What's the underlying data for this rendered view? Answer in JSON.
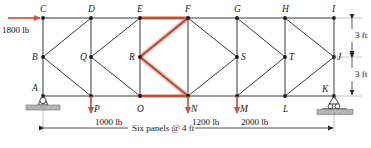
{
  "figure": {
    "type": "statics-truss",
    "span_label": "Six panels @ 4 ft",
    "height_label_upper": "3 ft",
    "height_label_lower": "3 ft"
  },
  "colors": {
    "member": "#3a3a3a",
    "highlight": "#e8694a",
    "load_arrow": "#d4503a",
    "support_fill": "#b8b8b8",
    "text": "#1a1a1a"
  },
  "joints": [
    {
      "id": "A",
      "label": "A",
      "x": 43,
      "y": 96,
      "label_dx": -11,
      "label_dy": -12
    },
    {
      "id": "B",
      "label": "B",
      "x": 43,
      "y": 57,
      "label_dx": -11,
      "label_dy": -4
    },
    {
      "id": "C",
      "label": "C",
      "x": 43,
      "y": 18,
      "label_dx": -3,
      "label_dy": -13
    },
    {
      "id": "D",
      "label": "D",
      "x": 91,
      "y": 18,
      "label_dx": -3,
      "label_dy": -13
    },
    {
      "id": "E",
      "label": "E",
      "x": 140,
      "y": 18,
      "label_dx": -3,
      "label_dy": -13
    },
    {
      "id": "F",
      "label": "F",
      "x": 188,
      "y": 18,
      "label_dx": -3,
      "label_dy": -13
    },
    {
      "id": "G",
      "label": "G",
      "x": 237,
      "y": 18,
      "label_dx": -3,
      "label_dy": -13
    },
    {
      "id": "H",
      "label": "H",
      "x": 285,
      "y": 18,
      "label_dx": -3,
      "label_dy": -13
    },
    {
      "id": "I",
      "label": "I",
      "x": 334,
      "y": 18,
      "label_dx": -2,
      "label_dy": -13
    },
    {
      "id": "J",
      "label": "J",
      "x": 334,
      "y": 57,
      "label_dx": 3,
      "label_dy": -4
    },
    {
      "id": "K",
      "label": "K",
      "x": 334,
      "y": 96,
      "label_dx": -12,
      "label_dy": -11
    },
    {
      "id": "L",
      "label": "L",
      "x": 285,
      "y": 96,
      "label_dx": -2,
      "label_dy": 9
    },
    {
      "id": "M",
      "label": "M",
      "x": 237,
      "y": 96,
      "label_dx": 3,
      "label_dy": 9
    },
    {
      "id": "N",
      "label": "N",
      "x": 188,
      "y": 96,
      "label_dx": 3,
      "label_dy": 9
    },
    {
      "id": "O",
      "label": "O",
      "x": 140,
      "y": 96,
      "label_dx": -3,
      "label_dy": 9
    },
    {
      "id": "P",
      "label": "P",
      "x": 91,
      "y": 96,
      "label_dx": 3,
      "label_dy": 9
    },
    {
      "id": "Q",
      "label": "Q",
      "x": 91,
      "y": 57,
      "label_dx": -11,
      "label_dy": -4
    },
    {
      "id": "R",
      "label": "R",
      "x": 140,
      "y": 57,
      "label_dx": -11,
      "label_dy": -4
    },
    {
      "id": "S",
      "label": "S",
      "x": 237,
      "y": 57,
      "label_dx": 4,
      "label_dy": -4
    },
    {
      "id": "T",
      "label": "T",
      "x": 285,
      "y": 57,
      "label_dx": 4,
      "label_dy": -4
    }
  ],
  "members": [
    {
      "from": "C",
      "to": "D",
      "highlight": false
    },
    {
      "from": "D",
      "to": "E",
      "highlight": false
    },
    {
      "from": "E",
      "to": "F",
      "highlight": true
    },
    {
      "from": "F",
      "to": "G",
      "highlight": false
    },
    {
      "from": "G",
      "to": "H",
      "highlight": false
    },
    {
      "from": "H",
      "to": "I",
      "highlight": false
    },
    {
      "from": "A",
      "to": "P",
      "highlight": false
    },
    {
      "from": "P",
      "to": "O",
      "highlight": false
    },
    {
      "from": "O",
      "to": "N",
      "highlight": true
    },
    {
      "from": "N",
      "to": "M",
      "highlight": false
    },
    {
      "from": "M",
      "to": "L",
      "highlight": false
    },
    {
      "from": "L",
      "to": "K",
      "highlight": false
    },
    {
      "from": "C",
      "to": "A",
      "highlight": false
    },
    {
      "from": "D",
      "to": "P",
      "highlight": false
    },
    {
      "from": "E",
      "to": "O",
      "highlight": false
    },
    {
      "from": "F",
      "to": "N",
      "highlight": false
    },
    {
      "from": "G",
      "to": "M",
      "highlight": false
    },
    {
      "from": "H",
      "to": "L",
      "highlight": false
    },
    {
      "from": "I",
      "to": "K",
      "highlight": false
    },
    {
      "from": "B",
      "to": "D",
      "highlight": false
    },
    {
      "from": "B",
      "to": "P",
      "highlight": false
    },
    {
      "from": "Q",
      "to": "E",
      "highlight": false
    },
    {
      "from": "Q",
      "to": "O",
      "highlight": false
    },
    {
      "from": "R",
      "to": "F",
      "highlight": true
    },
    {
      "from": "R",
      "to": "N",
      "highlight": true
    },
    {
      "from": "F",
      "to": "S",
      "highlight": false
    },
    {
      "from": "N",
      "to": "S",
      "highlight": false
    },
    {
      "from": "G",
      "to": "T",
      "highlight": false
    },
    {
      "from": "M",
      "to": "T",
      "highlight": false
    },
    {
      "from": "H",
      "to": "J",
      "highlight": false
    },
    {
      "from": "L",
      "to": "J",
      "highlight": false
    }
  ],
  "loads": [
    {
      "id": "load-1800",
      "label": "1800 lb",
      "magnitude": 1800,
      "unit": "lb",
      "direction": "right",
      "at_joint": "C",
      "text_x": 2,
      "text_y": 26
    },
    {
      "id": "load-1000",
      "label": "1000 lb",
      "magnitude": 1000,
      "unit": "lb",
      "direction": "down",
      "at_joint": "P",
      "text_x": 95,
      "text_y": 118
    },
    {
      "id": "load-1200",
      "label": "1200 lb",
      "magnitude": 1200,
      "unit": "lb",
      "direction": "down",
      "at_joint": "N",
      "text_x": 192,
      "text_y": 118
    },
    {
      "id": "load-2000",
      "label": "2000 lb",
      "magnitude": 2000,
      "unit": "lb",
      "direction": "down",
      "at_joint": "M",
      "text_x": 241,
      "text_y": 118
    }
  ],
  "supports": [
    {
      "id": "support-A",
      "type": "pin",
      "at_joint": "A"
    },
    {
      "id": "support-K",
      "type": "roller",
      "at_joint": "K"
    }
  ],
  "dimensions": {
    "span": {
      "label": "Six panels @ 4 ft",
      "x": 160,
      "y": 133
    },
    "upper_height": {
      "label": "3 ft",
      "x": 352,
      "y": 33
    },
    "lower_height": {
      "label": "3 ft",
      "x": 352,
      "y": 72
    }
  }
}
